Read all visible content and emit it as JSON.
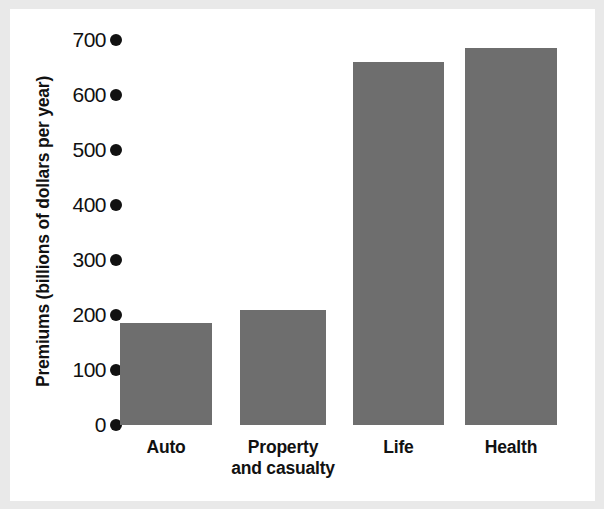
{
  "chart_data": {
    "type": "bar",
    "title": "",
    "xlabel": "",
    "ylabel": "Premiums (billions of dollars per year)",
    "categories": [
      "Auto",
      "Property and casualty",
      "Life",
      "Health"
    ],
    "category_label_lines": [
      [
        "Auto"
      ],
      [
        "Property",
        "and casualty"
      ],
      [
        "Life"
      ],
      [
        "Health"
      ]
    ],
    "values": [
      185,
      210,
      660,
      685
    ],
    "ylim": [
      0,
      700
    ],
    "yticks": [
      0,
      100,
      200,
      300,
      400,
      500,
      600,
      700
    ],
    "ytick_labels": [
      "0",
      "100",
      "200",
      "300",
      "400",
      "500",
      "600",
      "700"
    ],
    "grid": false,
    "legend": false,
    "tick_marker_style": "dot",
    "bar_color": "#6e6e6e",
    "axis_text_color": "#111111",
    "plot_background": "#ffffff",
    "page_background": "#e9e9e9"
  }
}
